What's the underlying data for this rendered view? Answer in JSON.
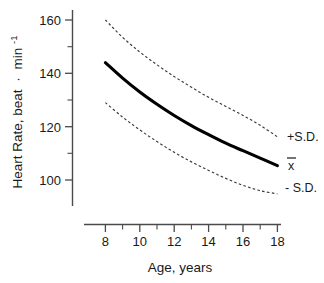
{
  "chart_data": {
    "type": "line",
    "title": "",
    "xlabel": "Age, years",
    "ylabel": "Heart Rate, beat · min",
    "ylabel_exponent": "-1",
    "xlim": [
      7,
      18.5
    ],
    "ylim": [
      88,
      165
    ],
    "xticks": [
      8,
      9,
      10,
      11,
      12,
      13,
      14,
      15,
      16,
      17,
      18
    ],
    "xtick_labels": [
      "8",
      "",
      "10",
      "",
      "12",
      "",
      "14",
      "",
      "16",
      "",
      "18"
    ],
    "yticks": [
      100,
      110,
      120,
      130,
      140,
      150,
      160
    ],
    "ytick_labels": [
      "100",
      "",
      "120",
      "",
      "140",
      "",
      "160"
    ],
    "grid": false,
    "legend_position": "right",
    "x": [
      8,
      9,
      10,
      11,
      12,
      13,
      14,
      15,
      16,
      17,
      18
    ],
    "series": [
      {
        "name": "+S.D.",
        "style": "dashed",
        "values": [
          160.0,
          153.5,
          148.0,
          143.2,
          138.8,
          134.8,
          131.0,
          127.6,
          124.2,
          120.5,
          116.2
        ]
      },
      {
        "name": "x̄",
        "style": "solid",
        "values": [
          144.0,
          138.2,
          133.0,
          128.4,
          124.2,
          120.4,
          117.0,
          113.8,
          111.0,
          108.2,
          105.4
        ]
      },
      {
        "name": "- S.D.",
        "style": "dashed",
        "values": [
          129.0,
          123.6,
          118.8,
          114.4,
          110.4,
          106.8,
          103.6,
          100.6,
          98.0,
          96.0,
          94.8
        ]
      }
    ],
    "annotations": [
      {
        "text": "+S.D.",
        "x": 18.6,
        "y": 116.2
      },
      {
        "text": "x̄",
        "x": 18.6,
        "y": 105.4
      },
      {
        "text": "- S.D.",
        "x": 18.6,
        "y": 94.8
      }
    ]
  },
  "axis": {
    "y_title_main": "Heart Rate, beat",
    "y_title_sep": "·",
    "y_title_unit": "min",
    "y_title_sup": "-1",
    "x_title": "Age, years",
    "ytick_160": "160",
    "ytick_140": "140",
    "ytick_120": "120",
    "ytick_100": "100",
    "xtick_8": "8",
    "xtick_10": "10",
    "xtick_12": "12",
    "xtick_14": "14",
    "xtick_16": "16",
    "xtick_18": "18"
  },
  "legend": {
    "plus_sd": "+S.D.",
    "mean": "x",
    "minus_sd": "- S.D."
  },
  "colors": {
    "axis": "#4a4a4a",
    "mean_curve": "#000000",
    "sd_curve": "#3a3a3a",
    "text": "#1a1a1a",
    "background": "#ffffff"
  }
}
